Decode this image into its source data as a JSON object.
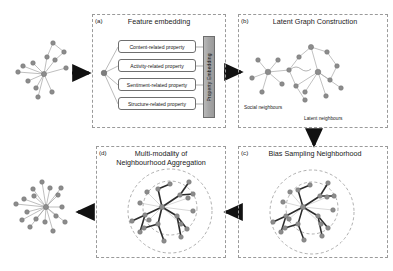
{
  "figure": {
    "background": "#ffffff",
    "node_color": "#8c8c8c",
    "node_stroke": "#6e6e6e",
    "edge_color": "#9e9e9e",
    "bold_edge_color": "#2b2b2b",
    "panel_border_color": "#9a9a9a",
    "arrow_color": "#111111"
  },
  "panels": {
    "a": {
      "label": "(a)",
      "title": "Feature embedding",
      "properties": [
        "Content-related property",
        "Activity-related property",
        "Sentiment-related property",
        "Structure-related property"
      ],
      "embedding_bar_label": "Property Embedding"
    },
    "b": {
      "label": "(b)",
      "title": "Latent Graph Construction",
      "annotations": [
        "Social neighbours",
        "Latent neighbours"
      ]
    },
    "c": {
      "label": "(c)",
      "title": "Bias Sampling Neighborhood"
    },
    "d": {
      "label": "(d)",
      "title_line1": "Multi-modality of",
      "title_line2": "Neighbourhood Aggregation"
    }
  },
  "graphs": {
    "input_top": {
      "nodes": [
        [
          44,
          74
        ],
        [
          33,
          63
        ],
        [
          23,
          66
        ],
        [
          18,
          72
        ],
        [
          28,
          81
        ],
        [
          36,
          88
        ],
        [
          38,
          97
        ],
        [
          52,
          92
        ],
        [
          55,
          60
        ],
        [
          64,
          52
        ],
        [
          53,
          43
        ],
        [
          66,
          68
        ],
        [
          47,
          57
        ]
      ],
      "edges": [
        [
          0,
          1
        ],
        [
          0,
          2
        ],
        [
          0,
          3
        ],
        [
          0,
          4
        ],
        [
          0,
          5
        ],
        [
          0,
          6
        ],
        [
          0,
          7
        ],
        [
          0,
          8
        ],
        [
          0,
          11
        ],
        [
          0,
          12
        ],
        [
          8,
          9
        ],
        [
          9,
          10
        ],
        [
          10,
          12
        ]
      ]
    },
    "input_bottom": {
      "nodes": [
        [
          46,
          207
        ],
        [
          34,
          196
        ],
        [
          24,
          199
        ],
        [
          16,
          204
        ],
        [
          27,
          212
        ],
        [
          36,
          219
        ],
        [
          30,
          227
        ],
        [
          45,
          222
        ],
        [
          56,
          216
        ],
        [
          62,
          207
        ],
        [
          58,
          195
        ],
        [
          50,
          188
        ],
        [
          42,
          182
        ],
        [
          33,
          189
        ],
        [
          65,
          222
        ],
        [
          53,
          231
        ],
        [
          22,
          220
        ],
        [
          61,
          188
        ]
      ],
      "edges": [
        [
          0,
          1
        ],
        [
          0,
          2
        ],
        [
          0,
          3
        ],
        [
          0,
          4
        ],
        [
          0,
          5
        ],
        [
          0,
          6
        ],
        [
          0,
          7
        ],
        [
          0,
          8
        ],
        [
          0,
          9
        ],
        [
          0,
          10
        ],
        [
          0,
          11
        ],
        [
          0,
          12
        ],
        [
          0,
          13
        ],
        [
          0,
          14
        ],
        [
          0,
          15
        ],
        [
          0,
          16
        ],
        [
          0,
          17
        ]
      ]
    }
  },
  "arrows": [
    {
      "name": "arrow-input-to-a",
      "x1": 70,
      "y1": 73,
      "x2": 92,
      "y2": 73
    },
    {
      "name": "arrow-a-to-b",
      "x1": 223,
      "y1": 72,
      "x2": 243,
      "y2": 72
    },
    {
      "name": "arrow-b-to-c",
      "x1": 314,
      "y1": 128,
      "x2": 314,
      "y2": 146
    },
    {
      "name": "arrow-c-to-d",
      "x1": 243,
      "y1": 212,
      "x2": 223,
      "y2": 212
    },
    {
      "name": "arrow-d-to-output",
      "x1": 95,
      "y1": 212,
      "x2": 75,
      "y2": 212
    }
  ]
}
